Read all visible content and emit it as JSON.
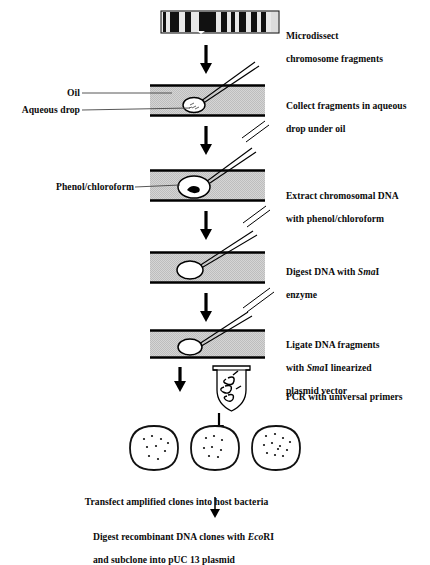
{
  "figure": {
    "title_hidden": "",
    "type": "scientific-workflow-diagram",
    "background_color": "#ffffff",
    "ink_color": "#000000",
    "slide_fill_color": "#c9c9c9",
    "slide_edge_color": "#000000"
  },
  "left_labels": [
    {
      "name": "oil",
      "text": "Oil"
    },
    {
      "name": "aqueous-drop",
      "text": "Aqueous drop"
    },
    {
      "name": "phenol-chloroform",
      "text": "Phenol/chloroform"
    }
  ],
  "steps": [
    {
      "id": "step-1",
      "name": "microdissect",
      "lines": [
        "Microdissect",
        "chromosome fragments"
      ]
    },
    {
      "id": "step-2",
      "name": "collect-fragments",
      "lines": [
        "Collect fragments in aqueous",
        "drop under oil"
      ]
    },
    {
      "id": "step-3",
      "name": "extract-dna",
      "lines": [
        "Extract chromosomal DNA",
        "with phenol/chloroform"
      ]
    },
    {
      "id": "step-4",
      "name": "digest-dna-smai",
      "line1_pre": "Digest DNA with ",
      "line1_italic": "Sma",
      "line1_post": "I",
      "line2": "enzyme"
    },
    {
      "id": "step-5",
      "name": "ligate-dna-fragments",
      "line1": "Ligate DNA fragments",
      "line2_pre": "with ",
      "line2_italic": "Sma",
      "line2_post": "I linearized",
      "line3": "plasmid vector"
    },
    {
      "id": "step-6",
      "name": "pcr-universal-primers",
      "lines": [
        "PCR with universal primers"
      ]
    }
  ],
  "bottom_steps": [
    {
      "id": "bottom-1",
      "name": "transfect-clones",
      "text": "Transfect amplified clones into host bacteria"
    },
    {
      "id": "bottom-2",
      "name": "digest-subclone",
      "line1_pre": "Digest recombinant DNA clones with ",
      "line1_italic": "Eco",
      "line1_post": "RI",
      "line2": "and subclone into pUC 13 plasmid"
    }
  ],
  "chromosome": {
    "name": "metaphase-chromosome",
    "band_count": 9,
    "bands_description": "alternating dark and light G-banding pattern"
  },
  "petri_dishes": [
    {
      "name": "petri-dish-1",
      "colonies": 9
    },
    {
      "name": "petri-dish-2",
      "colonies": 8
    },
    {
      "name": "petri-dish-3",
      "colonies": 12
    }
  ],
  "pcr_tube": {
    "name": "pcr-tube",
    "contents": "coiled DNA strand"
  }
}
